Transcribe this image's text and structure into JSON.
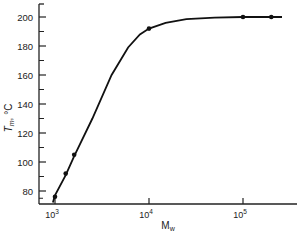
{
  "chart_data": {
    "type": "line",
    "title": "",
    "xlabel": "M_w",
    "ylabel": "T_m, °C",
    "xscale": "log",
    "xlim": [
      1000,
      300000
    ],
    "ylim": [
      70,
      210
    ],
    "xticks": [
      {
        "value": 1000,
        "base": "10",
        "exp": "3"
      },
      {
        "value": 10000,
        "base": "10",
        "exp": "4"
      },
      {
        "value": 100000,
        "base": "10",
        "exp": "5"
      }
    ],
    "yticks": [
      80,
      100,
      120,
      140,
      160,
      180,
      200
    ],
    "grid": false,
    "legend": null,
    "points": {
      "x": [
        1000,
        1300,
        1600,
        10000,
        100000,
        200000
      ],
      "y": [
        76,
        92,
        105,
        192,
        200,
        200
      ]
    },
    "curve": {
      "x": [
        950,
        1000,
        1300,
        1600,
        2500,
        4000,
        6000,
        8000,
        10000,
        15000,
        25000,
        50000,
        100000,
        200000,
        260000
      ],
      "y": [
        72,
        77,
        91,
        104,
        130,
        160,
        179,
        188,
        192,
        196,
        198.5,
        199.5,
        200,
        200,
        200
      ]
    }
  }
}
